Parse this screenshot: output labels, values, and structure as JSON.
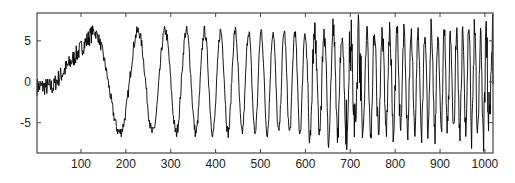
{
  "chart_data": {
    "type": "line",
    "title": "",
    "xlabel": "",
    "ylabel": "",
    "xlim": [
      2,
      1018
    ],
    "ylim": [
      -8.7,
      8.4
    ],
    "grid": false,
    "legend": null,
    "x_ticks": [
      100,
      200,
      300,
      400,
      500,
      600,
      700,
      800,
      900,
      1000
    ],
    "y_ticks": [
      5,
      0,
      -5
    ],
    "x_tick_labels": [
      "100",
      "200",
      "300",
      "400",
      "500",
      "600",
      "700",
      "800",
      "900",
      "1000"
    ],
    "y_tick_labels": [
      "5",
      "0",
      "-5"
    ],
    "line_color": "#000000",
    "series": [
      {
        "name": "signal",
        "description": "Noisy chirp: slow rise to ~6.5 near x=120, then oscillation of increasing frequency with amplitude ~6-7; dense noise bursts near x=700-720 and x=1000-1018",
        "n_points": 1024,
        "key_points": [
          {
            "x": 2,
            "y": 0.5
          },
          {
            "x": 20,
            "y": -1.5
          },
          {
            "x": 60,
            "y": 1.0
          },
          {
            "x": 120,
            "y": 6.5
          },
          {
            "x": 170,
            "y": -8.0
          },
          {
            "x": 220,
            "y": 6.0
          },
          {
            "x": 245,
            "y": 7.2
          },
          {
            "x": 300,
            "y": -7.0
          },
          {
            "x": 400,
            "y": 6.0
          },
          {
            "x": 500,
            "y": -6.5
          },
          {
            "x": 700,
            "y": 7.0
          },
          {
            "x": 800,
            "y": -6.5
          },
          {
            "x": 900,
            "y": 6.0
          },
          {
            "x": 1000,
            "y": 6.5
          }
        ]
      }
    ]
  },
  "plot_box": {
    "left": 37,
    "top": 13,
    "right": 493,
    "bottom": 153
  }
}
